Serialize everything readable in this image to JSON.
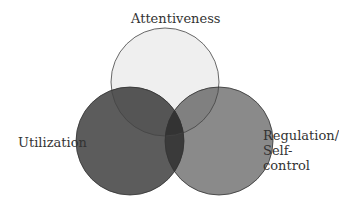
{
  "diagram": {
    "type": "venn",
    "sets": [
      {
        "label": "Attentiveness",
        "color": "#efefef"
      },
      {
        "label": "Utilization",
        "color": "#5c5c5c"
      },
      {
        "label_line1": "Regulation/",
        "label_line2": "Self-control",
        "color": "#8a8a8a"
      }
    ],
    "overlaps": {
      "attentiveness_utilization": "#555555",
      "attentiveness_regulation": "#808080",
      "utilization_regulation": "#3a3a3a",
      "all_three": "#333333"
    }
  }
}
